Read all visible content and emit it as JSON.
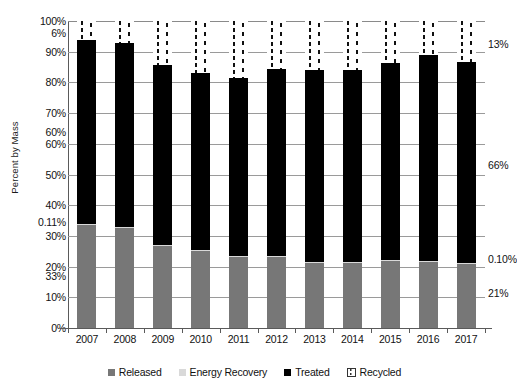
{
  "chart_data": {
    "type": "bar",
    "subtype": "stacked-column-100-partial",
    "title": "",
    "xlabel": "",
    "ylabel": "Percent by Mass",
    "ylim": [
      0,
      100
    ],
    "ytick_labels": [
      "100%",
      "90%",
      "80%",
      "70%",
      "60%",
      "50%",
      "40%",
      "30%",
      "20%",
      "10%",
      "0%"
    ],
    "ytick_values": [
      100,
      90,
      80,
      70,
      60,
      50,
      40,
      30,
      20,
      10,
      0
    ],
    "grid": true,
    "legend_position": "bottom",
    "categories": [
      "2007",
      "2008",
      "2009",
      "2010",
      "2011",
      "2012",
      "2013",
      "2014",
      "2015",
      "2016",
      "2017"
    ],
    "series": [
      {
        "name": "Released",
        "color": "#777777",
        "values": [
          33.8,
          32.9,
          27.0,
          25.3,
          23.3,
          23.5,
          21.5,
          21.3,
          22.0,
          21.8,
          21.0
        ]
      },
      {
        "name": "Energy Recovery",
        "color": "#d9d9d9",
        "values": [
          0.11,
          0.11,
          0.11,
          0.11,
          0.11,
          0.11,
          0.1,
          0.1,
          0.1,
          0.1,
          0.1
        ]
      },
      {
        "name": "Treated",
        "color": "#000000",
        "values": [
          60.0,
          59.8,
          58.7,
          57.6,
          57.9,
          60.9,
          62.6,
          62.6,
          64.3,
          66.9,
          65.7
        ]
      },
      {
        "name": "Recycled",
        "color": "#ffffff",
        "pattern": "vertical-dashed",
        "values": [
          6.0,
          7.2,
          14.2,
          17.0,
          18.7,
          15.5,
          15.8,
          16.0,
          13.6,
          11.2,
          13.2
        ]
      }
    ],
    "bar_tops_percent": [
      94.0,
      92.8,
      85.8,
      83.0,
      81.3,
      84.5,
      84.2,
      84.0,
      86.4,
      88.8,
      86.8
    ],
    "annotations": [
      {
        "text": "6%",
        "side": "left",
        "value": 96.0,
        "series": "Recycled"
      },
      {
        "text": "60%",
        "side": "left",
        "value": 64.0,
        "series": "Treated"
      },
      {
        "text": "0.11%",
        "side": "left",
        "value": 34.5,
        "series": "Energy Recovery"
      },
      {
        "text": "33%",
        "side": "left",
        "value": 17.0,
        "series": "Released"
      },
      {
        "text": "13%",
        "side": "right",
        "value": 92.5,
        "series": "Recycled"
      },
      {
        "text": "66%",
        "side": "right",
        "value": 53.0,
        "series": "Treated"
      },
      {
        "text": "0.10%",
        "side": "right",
        "value": 22.5,
        "series": "Energy Recovery"
      },
      {
        "text": "21%",
        "side": "right",
        "value": 11.5,
        "series": "Released"
      }
    ]
  },
  "legend": {
    "items": [
      {
        "label": "Released"
      },
      {
        "label": "Energy Recovery"
      },
      {
        "label": "Treated"
      },
      {
        "label": "Recycled"
      }
    ]
  }
}
